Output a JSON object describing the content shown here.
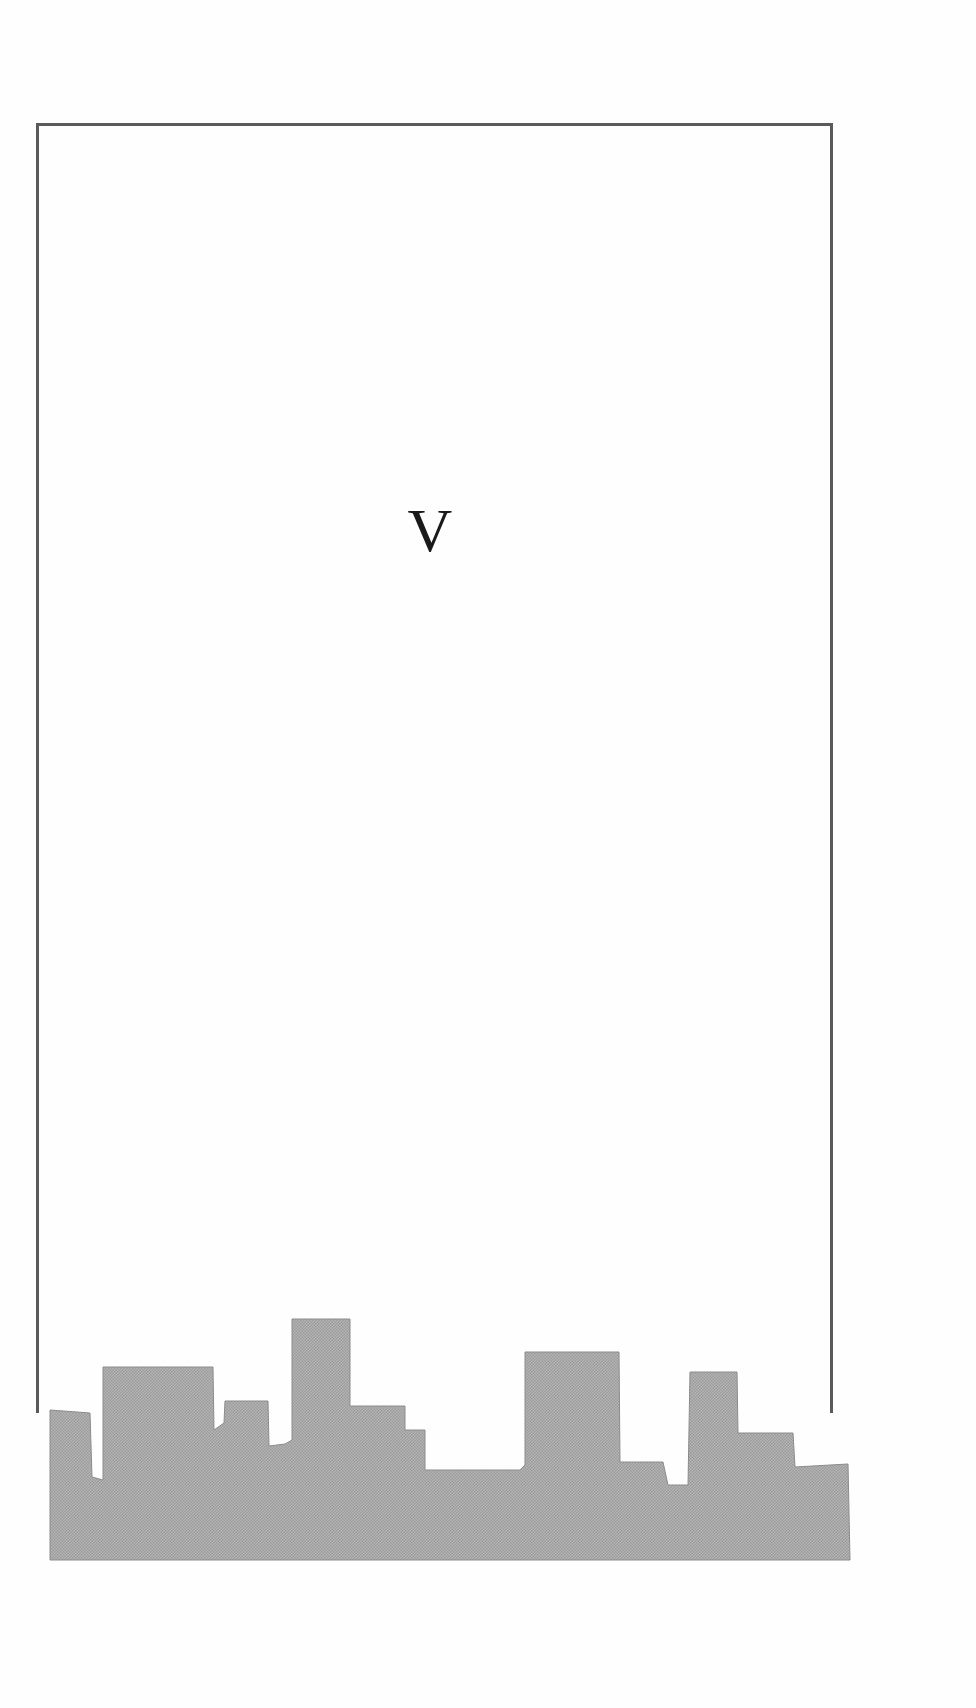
{
  "page": {
    "section_numeral": "V",
    "colors": {
      "background": "#fefefe",
      "frame_border": "#5a5a5a",
      "numeral_text": "#1a1a1a",
      "skyline_fill": "#a9a9a9"
    }
  },
  "illustration": {
    "description": "city skyline silhouette",
    "skyline_points": "50,1410 90,1413 92,1477 103,1480 103,1367 213,1367 214,1430 224,1423 225,1401 268,1401 269,1446 285,1444 292,1440 292,1319 350,1319 350,1406 405,1406 405,1430 425,1430 425,1470 520,1470 525,1465 525,1352 619,1352 620,1462 663,1462 668,1485 688,1485 690,1372 737,1372 738,1433 793,1433 795,1467 848,1464 850,1560 50,1560"
  }
}
